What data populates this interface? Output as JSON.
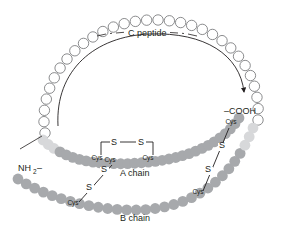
{
  "figure": {
    "background_color": "#ffffff",
    "width": 294,
    "height": 236
  },
  "colors": {
    "c_peptide_fill": "#ffffff",
    "c_peptide_stroke": "#6d6e71",
    "a_chain_fill": "#a7a9ac",
    "b_chain_fill": "#a7a9ac",
    "transition_fill": "#d7d8da",
    "line": "#231f20",
    "text": "#231f20"
  },
  "labels": {
    "c_peptide": "C peptide",
    "a_chain": "A chain",
    "b_chain": "B chain",
    "amino_terminus": "NH",
    "amino_terminus_sub": "2",
    "amino_terminus_dash": "–",
    "carboxy_terminus": "–COOH",
    "sulfur": "S",
    "cysteine": "Cys"
  },
  "cysteines": [
    {
      "id": "a-cys-6",
      "label": "Cys",
      "x": 97,
      "y": 160
    },
    {
      "id": "a-cys-7",
      "label": "Cys",
      "x": 110,
      "y": 162
    },
    {
      "id": "a-cys-11",
      "label": "Cys",
      "x": 148,
      "y": 160
    },
    {
      "id": "a-cys-20",
      "label": "Cys",
      "x": 231,
      "y": 124
    },
    {
      "id": "b-cys-7",
      "label": "Cys",
      "x": 73,
      "y": 205
    },
    {
      "id": "b-cys-19",
      "label": "Cys",
      "x": 198,
      "y": 194
    }
  ],
  "sulfurs": [
    {
      "id": "s-intra-left",
      "label": "S",
      "x": 114,
      "y": 145
    },
    {
      "id": "s-intra-right",
      "label": "S",
      "x": 141,
      "y": 145
    },
    {
      "id": "s-left-upper",
      "label": "S",
      "x": 104,
      "y": 172
    },
    {
      "id": "s-left-lower",
      "label": "S",
      "x": 89,
      "y": 190
    },
    {
      "id": "s-right-upper",
      "label": "S",
      "x": 222,
      "y": 148
    },
    {
      "id": "s-right-lower",
      "label": "S",
      "x": 208,
      "y": 172
    }
  ],
  "chain_data": {
    "c_peptide_bead_count": 31,
    "a_chain_bead_count": 32,
    "b_chain_bead_count": 30,
    "disulfide_bonds": [
      {
        "type": "intrachain",
        "chain": "A",
        "from": "Cys",
        "to": "Cys"
      },
      {
        "type": "interchain",
        "from_chain": "A",
        "to_chain": "B",
        "from": "Cys",
        "to": "Cys"
      },
      {
        "type": "interchain",
        "from_chain": "A",
        "to_chain": "B",
        "from": "Cys",
        "to": "Cys"
      }
    ]
  }
}
